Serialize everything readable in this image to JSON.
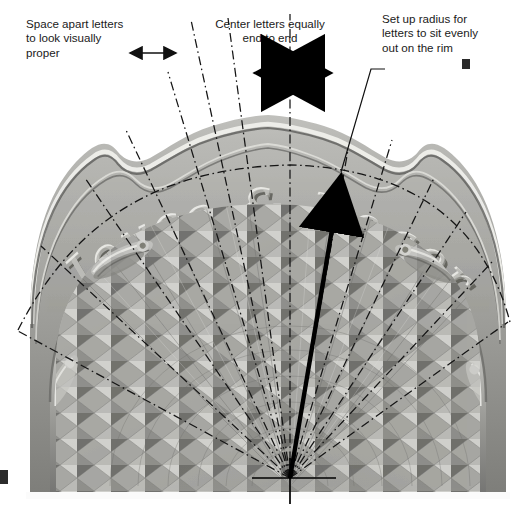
{
  "annotations": [
    {
      "id": "space-apart",
      "name": "annotation-space-apart-letters",
      "text": "Space apart letters\nto look visually\nproper",
      "pointer": "double-headed-arrow-thin",
      "x": 26,
      "y": 17
    },
    {
      "id": "center-letters",
      "name": "annotation-center-letters",
      "text": "Center letters equally\nend to end",
      "pointer": "double-headed-arrow-thick",
      "x": 186,
      "y": 17
    },
    {
      "id": "set-radius",
      "name": "annotation-set-up-radius",
      "text": "Set up radius for\nletters to sit evenly\nout on the rim",
      "pointer": "leader-line-to-radius-arrow",
      "x": 382,
      "y": 12
    }
  ],
  "carving": {
    "inscription": "Joyce & Roger",
    "inscription_parts": [
      "Joyce",
      "&",
      "Roger"
    ],
    "rim_style": "scalloped moulded rim",
    "bowl_style": "diamond lattice chip carving"
  },
  "guides": {
    "radial_line_style": "dash-dot",
    "radial_line_color": "#1c1c1c",
    "center_point": {
      "x": 290,
      "y": 478
    },
    "baseline_arc": "dash-dot arc through letter baselines",
    "radius_arrow": {
      "from_x": 290,
      "from_y": 478,
      "to_x": 341,
      "to_y": 170
    },
    "vertical_centerline": true
  },
  "colors": {
    "background": "#ffffff",
    "text": "#1a1a1a",
    "line": "#1c1c1c",
    "photo_light": "#e8e8e6",
    "photo_mid": "#9a9a98",
    "photo_dark": "#4b4b4a"
  }
}
